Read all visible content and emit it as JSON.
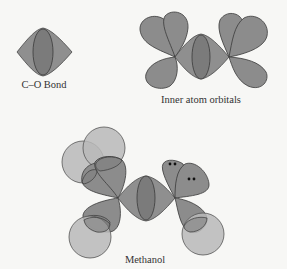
{
  "labels": {
    "co_bond": "C–O Bond",
    "inner_orbitals": "Inner atom orbitals",
    "methanol": "Methanol"
  },
  "colors": {
    "background": "#f7f7f5",
    "lobe_fill": "#8c8c8c",
    "inner_ellipse_fill": "#7a7a7a",
    "hydrogen_fill": "#b4b4b4",
    "stroke": "#3a3a3a",
    "lone_pair_dot": "#111111"
  },
  "panels": [
    {
      "name": "C-O Bond",
      "description": "sigma bond lens with central ellipse"
    },
    {
      "name": "Inner atom orbitals",
      "description": "central bond with three teardrop lobes on each atom"
    },
    {
      "name": "Methanol",
      "description": "orbitals with three hydrogen spheres on carbon and two lone pairs on oxygen"
    }
  ],
  "lone_pairs": 2
}
